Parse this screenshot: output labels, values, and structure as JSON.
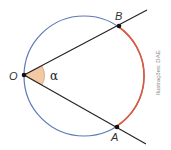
{
  "diagram": {
    "points": {
      "O": {
        "label": "O",
        "x": 24,
        "y": 75
      },
      "B": {
        "label": "B",
        "x": 119,
        "y": 26
      },
      "A": {
        "label": "A",
        "x": 117,
        "y": 127
      }
    },
    "angle_label": "α",
    "circle": {
      "cx": 84,
      "cy": 76,
      "r": 60
    },
    "colors": {
      "circle": "#5b78b8",
      "arc_AB": "#e0583a",
      "lines": "#222222",
      "angle_fill": "#f3c9a4",
      "points": "#111111"
    },
    "credit": "Ilustrações: DAE"
  }
}
